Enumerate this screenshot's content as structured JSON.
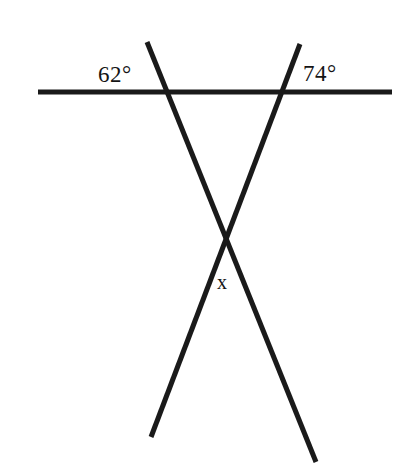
{
  "figure": {
    "background_color": "#ffffff",
    "stroke_color": "#1a1a1a",
    "stroke_width": 5
  },
  "labels": {
    "left_angle": "62°",
    "right_angle": "74°",
    "unknown_angle": "x"
  },
  "geometry": {
    "horizontal_line": {
      "name": "horizontal-transversal",
      "x1": 38,
      "y1": 92,
      "x2": 392,
      "y2": 92
    },
    "left_line": {
      "name": "left-slanted-line",
      "x1": 147,
      "y1": 42,
      "x2": 316,
      "y2": 462
    },
    "right_line": {
      "name": "right-slanted-line",
      "x1": 300,
      "y1": 44,
      "x2": 151,
      "y2": 437
    },
    "vertices": {
      "left_intersection": {
        "x": 158,
        "y": 92
      },
      "right_intersection": {
        "x": 284,
        "y": 92
      },
      "apex_crossing": {
        "x": 222,
        "y": 243
      }
    }
  }
}
